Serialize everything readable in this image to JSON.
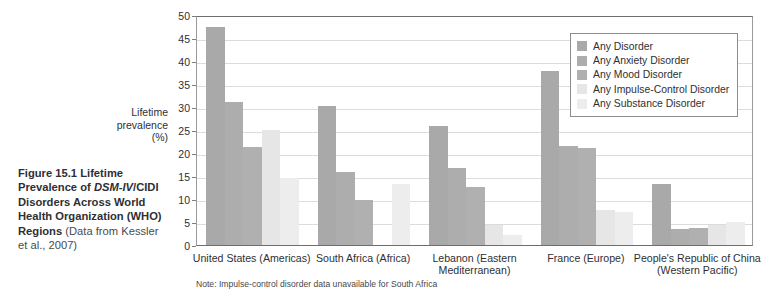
{
  "caption": {
    "figure_number": "Figure 15.1",
    "title_part1": "Lifetime Prevalence of ",
    "title_em": "DSM-IV",
    "title_part2": "/CIDI Disorders Across World Health Organization (WHO) Regions",
    "source": " (Data from Kessler et al., 2007)"
  },
  "note": "Note: Impulse-control disorder data unavailable for South Africa",
  "colors": {
    "any_disorder": "#a9a9a9",
    "any_anxiety": "#adadad",
    "any_mood": "#b0b0b0",
    "any_impulse": "#e6e6e6",
    "any_substance": "#ededed",
    "grid": "#dcdcde",
    "axis": "#6e6e70",
    "text": "#2f2f33"
  },
  "chart_data": {
    "type": "bar",
    "title": "Lifetime Prevalence of DSM-IV/CIDI Disorders Across World Health Organization (WHO) Regions",
    "xlabel": "",
    "ylabel": "Lifetime prevalence (%)",
    "ylabel_lines": [
      "Lifetime",
      "prevalence",
      "(%)"
    ],
    "ylim": [
      0,
      50
    ],
    "yticks": [
      0,
      5,
      10,
      15,
      20,
      25,
      30,
      35,
      40,
      45,
      50
    ],
    "ytick_labels": [
      "0",
      "5",
      "10",
      "15",
      "20",
      "25",
      "30",
      "35",
      "40",
      "45",
      "50"
    ],
    "grid": true,
    "legend_position": "upper right",
    "categories": [
      "United States (Americas)",
      "South Africa (Africa)",
      "Lebanon (Eastern Mediterranean)",
      "France (Europe)",
      "People's Republic of China (Western Pacific)"
    ],
    "category_lines": [
      [
        "United States (Americas)"
      ],
      [
        "South Africa (Africa)"
      ],
      [
        "Lebanon (Eastern",
        "Mediterranean)"
      ],
      [
        "France (Europe)"
      ],
      [
        "People's Republic of China",
        "(Western Pacific)"
      ]
    ],
    "series": [
      {
        "name": "Any Disorder",
        "color": "#a9a9a9",
        "values": [
          47.4,
          30.3,
          25.8,
          37.9,
          13.2
        ]
      },
      {
        "name": "Any Anxiety Disorder",
        "color": "#adadad",
        "values": [
          31.0,
          15.8,
          16.7,
          21.6,
          3.4
        ]
      },
      {
        "name": "Any Mood Disorder",
        "color": "#b0b0b0",
        "values": [
          21.4,
          9.8,
          12.6,
          21.0,
          3.6
        ]
      },
      {
        "name": "Any Impulse-Control Disorder",
        "color": "#e6e6e6",
        "values": [
          25.0,
          null,
          4.4,
          7.6,
          4.3
        ]
      },
      {
        "name": "Any Substance Disorder",
        "color": "#ededed",
        "values": [
          14.6,
          13.3,
          2.2,
          7.1,
          4.9
        ]
      }
    ]
  }
}
